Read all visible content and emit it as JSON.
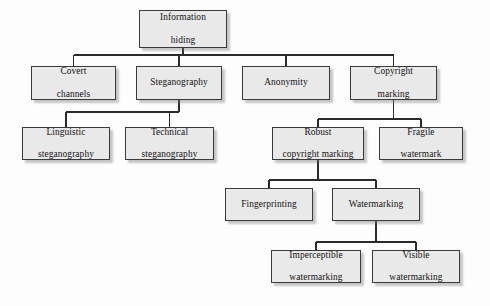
{
  "diagram": {
    "type": "tree",
    "background_color": "#fdfdfd",
    "node_fill_color": "#e9e9e9",
    "node_border_color": "#3a3a3a",
    "edge_color": "#2b2b2b",
    "nodes": [
      {
        "id": "information-hiding",
        "label": "Information hiding",
        "line1": "Information",
        "line2": "hiding",
        "x": 139,
        "y": 10,
        "w": 88,
        "h": 38,
        "level": 0
      },
      {
        "id": "covert-channels",
        "label": "Covert channels",
        "line1": "Covert",
        "line2": "channels",
        "x": 31,
        "y": 66,
        "w": 85,
        "h": 34,
        "level": 1
      },
      {
        "id": "steganography",
        "label": "Steganography",
        "line1": "Steganography",
        "line2": "",
        "x": 136,
        "y": 66,
        "w": 86,
        "h": 34,
        "level": 1
      },
      {
        "id": "anonymity",
        "label": "Anonymity",
        "line1": "Anonymity",
        "line2": "",
        "x": 242,
        "y": 66,
        "w": 88,
        "h": 34,
        "level": 1
      },
      {
        "id": "copyright-marking",
        "label": "Copyright marking",
        "line1": "Copyright",
        "line2": "marking",
        "x": 350,
        "y": 66,
        "w": 87,
        "h": 34,
        "level": 1
      },
      {
        "id": "linguistic-steganography",
        "label": "Linguistic steganography",
        "line1": "Linguistic",
        "line2": "steganography",
        "x": 22,
        "y": 127,
        "w": 88,
        "h": 33,
        "level": 2
      },
      {
        "id": "technical-steganography",
        "label": "Technical steganography",
        "line1": "Technical",
        "line2": "steganography",
        "x": 125,
        "y": 127,
        "w": 89,
        "h": 33,
        "level": 2
      },
      {
        "id": "robust-copyright-marking",
        "label": "Robust copyright marking",
        "line1": "Robust",
        "line2": "copyright marking",
        "x": 272,
        "y": 127,
        "w": 92,
        "h": 33,
        "level": 2
      },
      {
        "id": "fragile-watermark",
        "label": "Fragile watermark",
        "line1": "Fragile",
        "line2": "watermark",
        "x": 379,
        "y": 127,
        "w": 84,
        "h": 33,
        "level": 2
      },
      {
        "id": "fingerprinting",
        "label": "Fingerprinting",
        "line1": "Fingerprinting",
        "line2": "",
        "x": 225,
        "y": 188,
        "w": 88,
        "h": 33,
        "level": 3
      },
      {
        "id": "watermarking",
        "label": "Watermarking",
        "line1": "Watermarking",
        "line2": "",
        "x": 332,
        "y": 188,
        "w": 88,
        "h": 33,
        "level": 3
      },
      {
        "id": "imperceptible-watermarking",
        "label": "Imperceptible watermarking",
        "line1": "Imperceptible",
        "line2": "watermarking",
        "x": 271,
        "y": 250,
        "w": 90,
        "h": 33,
        "level": 4
      },
      {
        "id": "visible-watermarking",
        "label": "Visible watermarking",
        "line1": "Visible",
        "line2": "watermarking",
        "x": 372,
        "y": 250,
        "w": 88,
        "h": 33,
        "level": 4
      }
    ],
    "edges": [
      {
        "id": "edge-root-covert",
        "from": "information-hiding",
        "to": "covert-channels"
      },
      {
        "id": "edge-root-steganography",
        "from": "information-hiding",
        "to": "steganography"
      },
      {
        "id": "edge-root-anonymity",
        "from": "information-hiding",
        "to": "anonymity"
      },
      {
        "id": "edge-root-copyright",
        "from": "information-hiding",
        "to": "copyright-marking"
      },
      {
        "id": "edge-steg-linguistic",
        "from": "steganography",
        "to": "linguistic-steganography"
      },
      {
        "id": "edge-steg-technical",
        "from": "steganography",
        "to": "technical-steganography"
      },
      {
        "id": "edge-copyright-robust",
        "from": "copyright-marking",
        "to": "robust-copyright-marking"
      },
      {
        "id": "edge-copyright-fragile",
        "from": "copyright-marking",
        "to": "fragile-watermark"
      },
      {
        "id": "edge-robust-fingerprint",
        "from": "robust-copyright-marking",
        "to": "fingerprinting"
      },
      {
        "id": "edge-robust-watermarking",
        "from": "robust-copyright-marking",
        "to": "watermarking"
      },
      {
        "id": "edge-wm-imperceptible",
        "from": "watermarking",
        "to": "imperceptible-watermarking"
      },
      {
        "id": "edge-wm-visible",
        "from": "watermarking",
        "to": "visible-watermarking"
      }
    ]
  }
}
